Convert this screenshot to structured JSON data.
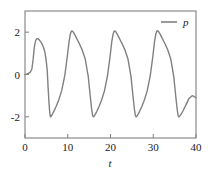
{
  "chart_data": {
    "type": "line",
    "title": "",
    "xlabel": "t",
    "ylabel": "",
    "xlim": [
      0,
      40
    ],
    "ylim": [
      -3.0,
      3.0
    ],
    "xticks": [
      0,
      10,
      20,
      30,
      40
    ],
    "xtick_labels": [
      "0",
      "10",
      "20",
      "30",
      "40"
    ],
    "yticks": [
      -2,
      0,
      2
    ],
    "ytick_labels": [
      "-2",
      "0",
      "2"
    ],
    "grid": false,
    "legend_position": "top-right",
    "series": [
      {
        "name": "p",
        "color": "#808080",
        "linewidth": 1.4,
        "x": [
          0.0,
          0.4,
          0.8,
          1.2,
          1.6,
          1.9,
          2.1,
          2.3,
          2.5,
          2.7,
          2.9,
          3.1,
          3.4,
          3.7,
          4.0,
          4.3,
          4.6,
          4.9,
          5.2,
          5.4,
          5.6,
          5.75,
          5.85,
          5.95,
          6.1,
          6.4,
          6.8,
          7.3,
          7.9,
          8.6,
          9.3,
          9.9,
          10.3,
          10.6,
          10.8,
          10.95,
          11.1,
          11.3,
          11.6,
          11.9,
          12.3,
          12.8,
          13.4,
          14.1,
          14.8,
          15.3,
          15.6,
          15.8,
          15.95,
          16.1,
          16.4,
          16.8,
          17.3,
          17.9,
          18.6,
          19.3,
          19.9,
          20.3,
          20.6,
          20.8,
          20.95,
          21.1,
          21.3,
          21.6,
          21.9,
          22.3,
          22.8,
          23.4,
          24.1,
          24.8,
          25.3,
          25.6,
          25.8,
          25.95,
          26.1,
          26.4,
          26.8,
          27.3,
          27.9,
          28.6,
          29.3,
          29.9,
          30.3,
          30.6,
          30.8,
          30.95,
          31.1,
          31.3,
          31.6,
          31.9,
          32.3,
          32.8,
          33.4,
          34.1,
          34.8,
          35.3,
          35.6,
          35.8,
          35.95,
          36.1,
          36.5,
          37.0,
          37.6,
          38.3,
          39.1,
          39.6,
          40.0
        ],
        "y": [
          0.0,
          0.02,
          0.05,
          0.1,
          0.25,
          0.7,
          1.15,
          1.45,
          1.6,
          1.68,
          1.7,
          1.68,
          1.62,
          1.54,
          1.44,
          1.3,
          1.1,
          0.75,
          0.2,
          -0.6,
          -1.3,
          -1.7,
          -1.9,
          -2.0,
          -1.98,
          -1.88,
          -1.72,
          -1.5,
          -1.2,
          -0.75,
          -0.05,
          0.85,
          1.55,
          1.9,
          2.02,
          2.06,
          2.05,
          2.0,
          1.9,
          1.78,
          1.62,
          1.42,
          1.15,
          0.72,
          -0.1,
          -1.1,
          -1.65,
          -1.92,
          -2.0,
          -1.99,
          -1.9,
          -1.74,
          -1.52,
          -1.22,
          -0.76,
          -0.05,
          0.85,
          1.55,
          1.9,
          2.02,
          2.06,
          2.05,
          2.0,
          1.9,
          1.78,
          1.62,
          1.42,
          1.15,
          0.72,
          -0.1,
          -1.1,
          -1.65,
          -1.92,
          -2.0,
          -1.99,
          -1.9,
          -1.74,
          -1.52,
          -1.22,
          -0.76,
          -0.05,
          0.85,
          1.55,
          1.9,
          2.03,
          2.07,
          2.06,
          2.01,
          1.91,
          1.79,
          1.63,
          1.43,
          1.16,
          0.73,
          -0.1,
          -1.1,
          -1.65,
          -1.92,
          -2.0,
          -1.99,
          -1.88,
          -1.7,
          -1.46,
          -1.15,
          -1.0,
          -1.05,
          -1.1
        ]
      }
    ],
    "legend_entries": [
      {
        "label": "p",
        "color": "#808080"
      }
    ]
  },
  "figure": {
    "background": "#ffffff",
    "axis_color": "#808080",
    "text_color": "#1a1a1a"
  }
}
